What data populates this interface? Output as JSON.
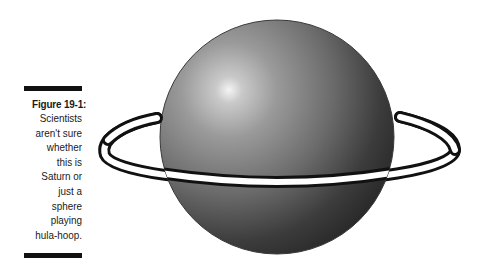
{
  "figure": {
    "label": "Figure 19-1:",
    "caption_lines": [
      "Scientists",
      "aren't sure",
      "whether",
      "this is",
      "Saturn or",
      "just a",
      "sphere",
      "playing",
      "hula-hoop."
    ],
    "illustration": {
      "subject": "sphere with ring",
      "colors": {
        "sphere_highlight": "#f2f2f2",
        "sphere_mid": "#8a8a8a",
        "sphere_shadow": "#2a2a2a",
        "ring_fill": "#ffffff",
        "ring_outline": "#111111",
        "rule": "#111111"
      }
    }
  }
}
